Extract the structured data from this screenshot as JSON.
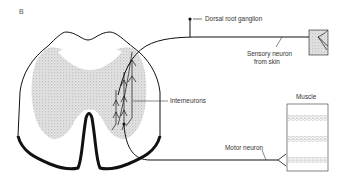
{
  "figure": {
    "panel_label": "B",
    "labels": {
      "dorsal_root_ganglion": "Dorsal root ganglion",
      "sensory_neuron_line1": "Sensory neuron",
      "sensory_neuron_line2": "from skin",
      "interneurons": "Interneurons",
      "muscle": "Muscle",
      "motor_neuron": "Motor neuron"
    },
    "colors": {
      "ink": "#111111",
      "stipple": "#cfcfcf",
      "label": "#333333"
    }
  }
}
